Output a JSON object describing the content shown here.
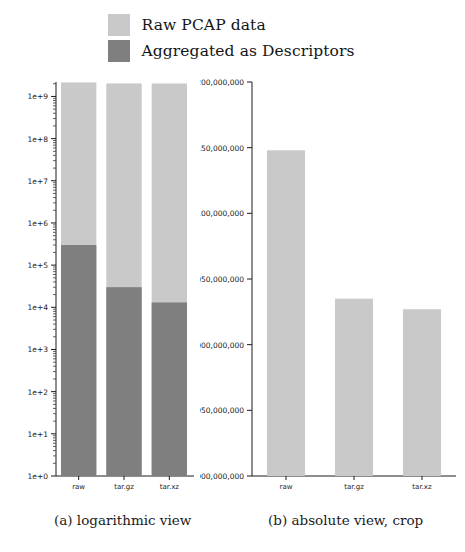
{
  "legend": {
    "items": [
      {
        "label": "Raw PCAP data",
        "color": "#c9c9c9",
        "name": "raw-pcap-data"
      },
      {
        "label": "Aggregated as Descriptors",
        "color": "#7f7f7f",
        "name": "aggregated-as-descriptors"
      }
    ]
  },
  "captions": {
    "a": "(a) logarithmic view",
    "b": "(b) absolute view, crop"
  },
  "chart_data": [
    {
      "type": "bar",
      "id": "logarithmic-view",
      "title": "",
      "subtitle": "(a) logarithmic view",
      "stacked": true,
      "xlabel": "",
      "ylabel": "",
      "yscale": "log",
      "ylim": [
        1,
        2200000000
      ],
      "grid": false,
      "legend_position": "above-figure",
      "categories": [
        "raw",
        "tar.gz",
        "tar.xz"
      ],
      "ytick_labels": [
        "1e+0",
        "1e+1",
        "1e+2",
        "1e+3",
        "1e+4",
        "1e+5",
        "1e+6",
        "1e+7",
        "1e+8",
        "1e+9"
      ],
      "ytick_values": [
        1,
        10,
        100,
        1000,
        10000,
        100000,
        1000000,
        10000000,
        100000000,
        1000000000
      ],
      "series": [
        {
          "name": "Raw PCAP data",
          "color": "#c9c9c9",
          "values": [
            2148000000,
            2035000000,
            2027000000
          ]
        },
        {
          "name": "Aggregated as Descriptors",
          "color": "#7f7f7f",
          "values": [
            300000,
            30000,
            13000
          ]
        }
      ]
    },
    {
      "type": "bar",
      "id": "absolute-view-crop",
      "title": "",
      "subtitle": "(b) absolute view, crop",
      "stacked": false,
      "xlabel": "",
      "ylabel": "",
      "yscale": "linear",
      "ylim": [
        1900000000,
        2200000000
      ],
      "grid": false,
      "legend_position": "above-figure",
      "categories": [
        "raw",
        "tar.gz",
        "tar.xz"
      ],
      "ytick_labels": [
        "1,900,000,000",
        "1,950,000,000",
        "2,000,000,000",
        "2,050,000,000",
        "2,100,000,000",
        "2,150,000,000",
        "2,200,000,000"
      ],
      "ytick_values": [
        1900000000,
        1950000000,
        2000000000,
        2050000000,
        2100000000,
        2150000000,
        2200000000
      ],
      "series": [
        {
          "name": "Raw PCAP data",
          "color": "#c9c9c9",
          "values": [
            2148000000,
            2035000000,
            2027000000
          ]
        }
      ]
    }
  ]
}
